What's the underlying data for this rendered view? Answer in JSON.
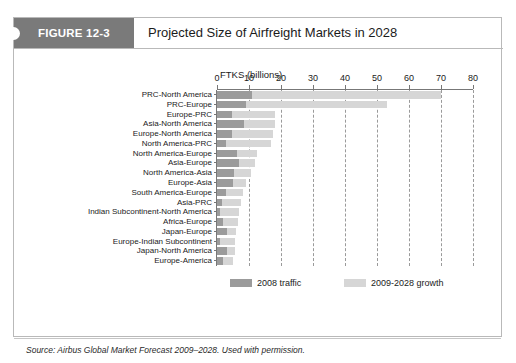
{
  "figure": {
    "tag_label": "FIGURE 12-3",
    "title": "Projected Size of Airfreight Markets in 2028",
    "source": "Source: Airbus Global Market Forecast 2009–2028. Used with permission."
  },
  "colors": {
    "tag_background": "#7a7a7a",
    "tag_text": "#ffffff",
    "series_2008": "#9b9b9b",
    "series_growth": "#d6d6d6",
    "axis": "#777777",
    "grid": "#9a9a9a",
    "frame": "#b9b9b9"
  },
  "legend": {
    "position": "bottom",
    "entries": [
      {
        "label": "2008 traffic",
        "color": "#9b9b9b"
      },
      {
        "label": "2009-2028 growth",
        "color": "#d6d6d6"
      }
    ]
  },
  "chart_data": {
    "type": "bar",
    "orientation": "horizontal",
    "stacked": true,
    "title": "Projected Size of Airfreight Markets in 2028",
    "xlabel": "FTKS (billions)",
    "ylabel": "",
    "xlim": [
      0,
      80
    ],
    "xticks": [
      0,
      10,
      20,
      30,
      40,
      50,
      60,
      70,
      80
    ],
    "xticklabels": [
      "0",
      "10",
      "20",
      "30",
      "40",
      "50",
      "60",
      "70",
      "80"
    ],
    "grid": "vertical-dashed",
    "axis_position": "top",
    "categories": [
      "PRC-North America",
      "PRC-Europe",
      "Europe-PRC",
      "Asia-North America",
      "Europe-North America",
      "North America-PRC",
      "North America-Europe",
      "Asia-Europe",
      "North America-Asia",
      "Europe-Asia",
      "South America-Europe",
      "Asia-PRC",
      "Indian Subcontinent-North America",
      "Africa-Europe",
      "Japan-Europe",
      "Europe-Indian Subcontinent",
      "Japan-North America",
      "Europe-America"
    ],
    "series": [
      {
        "name": "2008 traffic",
        "color": "#9b9b9b",
        "values": [
          11.0,
          9.0,
          4.8,
          8.4,
          4.8,
          2.8,
          6.2,
          7.0,
          5.4,
          5.0,
          2.8,
          1.5,
          1.0,
          2.0,
          3.0,
          1.0,
          3.0,
          2.0
        ]
      },
      {
        "name": "2009-2028 growth",
        "color": "#d6d6d6",
        "values": [
          59.0,
          44.0,
          13.2,
          9.6,
          12.7,
          14.2,
          6.3,
          5.0,
          5.1,
          4.0,
          5.2,
          6.0,
          6.0,
          4.5,
          3.0,
          4.5,
          2.5,
          3.0
        ]
      }
    ],
    "totals": [
      70.0,
      53.0,
      18.0,
      18.0,
      17.5,
      17.0,
      12.5,
      12.0,
      10.5,
      9.0,
      8.0,
      7.5,
      7.0,
      6.5,
      6.0,
      5.5,
      5.5,
      5.0
    ]
  }
}
